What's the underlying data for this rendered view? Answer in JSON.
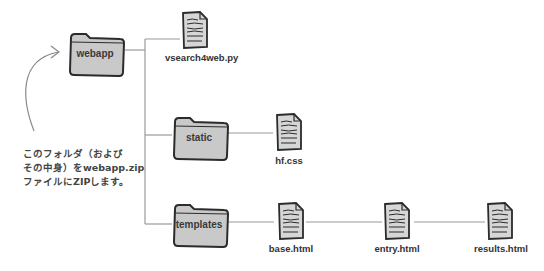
{
  "diagram": {
    "folders": [
      {
        "id": "webapp",
        "label": "webapp"
      },
      {
        "id": "static",
        "label": "static"
      },
      {
        "id": "templates",
        "label": "templates"
      }
    ],
    "files": [
      {
        "id": "vsearch4web",
        "label": "vsearch4web.py",
        "parent": "webapp"
      },
      {
        "id": "hfcss",
        "label": "hf.css",
        "parent": "static"
      },
      {
        "id": "base",
        "label": "base.html",
        "parent": "templates"
      },
      {
        "id": "entry",
        "label": "entry.html",
        "parent": "templates"
      },
      {
        "id": "results",
        "label": "results.html",
        "parent": "templates"
      }
    ],
    "annotation": {
      "lines": [
        "このフォルダ（および",
        "その中身）をwebapp.zip",
        "ファイルにZIPします。"
      ],
      "arrow_target": "webapp"
    },
    "colors": {
      "folder_fill": "#c9c9c9",
      "folder_stroke": "#2b2b2b",
      "connector": "#9a9a9a",
      "doc_fill": "#d6d6d6",
      "text": "#333333"
    }
  }
}
